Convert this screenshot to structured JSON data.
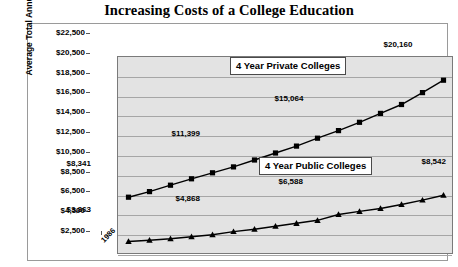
{
  "chart_data": {
    "type": "line",
    "title": "Increasing Costs of a College Education",
    "xlabel": "",
    "ylabel": "Average Total Annual Costs for College",
    "categories": [
      "1986",
      "1987",
      "1988",
      "1989",
      "1990",
      "1991",
      "1992",
      "1993",
      "1994",
      "1995",
      "1996",
      "1997",
      "1998",
      "1999",
      "2000",
      "2001"
    ],
    "ylim": [
      2500,
      22500
    ],
    "ytick_step": 2000,
    "ytick_labels": [
      "$22,500",
      "$20,500",
      "$18,500",
      "$16,500",
      "$14,500",
      "$12,500",
      "$10,500",
      "$8,500",
      "$6,500",
      "$4,500",
      "$2,500"
    ],
    "grid": true,
    "legend_position": "inline-callouts",
    "series": [
      {
        "name": "4 Year Private Colleges",
        "marker": "square",
        "values": [
          8341,
          8900,
          9550,
          10200,
          10800,
          11399,
          12100,
          12800,
          13500,
          14300,
          15064,
          15900,
          16800,
          17700,
          18900,
          20160
        ],
        "point_labels": [
          {
            "index": 0,
            "text": "$8,341"
          },
          {
            "index": 5,
            "text": "$11,399"
          },
          {
            "index": 10,
            "text": "$15,064"
          },
          {
            "index": 15,
            "text": "$20,160"
          }
        ]
      },
      {
        "name": "4 Year Public Colleges",
        "marker": "triangle",
        "values": [
          3863,
          4000,
          4150,
          4350,
          4550,
          4868,
          5100,
          5400,
          5700,
          6000,
          6588,
          6900,
          7200,
          7600,
          8050,
          8542
        ],
        "point_labels": [
          {
            "index": 0,
            "text": "$3,863"
          },
          {
            "index": 5,
            "text": "$4,868"
          },
          {
            "index": 10,
            "text": "$6,588"
          },
          {
            "index": 15,
            "text": "$8,542"
          }
        ]
      }
    ],
    "callouts": [
      {
        "name": "private-series-callout",
        "text": "4 Year Private Colleges"
      },
      {
        "name": "public-series-callout",
        "text": "4 Year Public Colleges"
      }
    ],
    "colors": {
      "plot_background": "#e3e3e3",
      "gridline": "#a6a6a6",
      "series_line": "#000000",
      "frame": "#9a9a9a",
      "text": "#000000"
    }
  }
}
